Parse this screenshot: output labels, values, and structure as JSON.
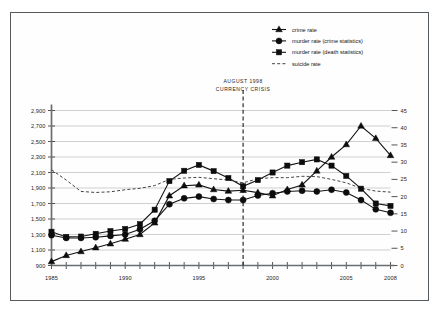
{
  "figure": {
    "border_color": "#555a5e",
    "background": "#ffffff"
  },
  "annotation": {
    "line1": "AUGUST 1998",
    "line2": "CURRENCY CRISIS",
    "year": 1998
  },
  "legend": {
    "position": "top-right",
    "items": [
      {
        "label": "crime rate",
        "marker": "triangle",
        "style": "solid"
      },
      {
        "label": "murder rate (crime statistics)",
        "marker": "circle",
        "style": "solid"
      },
      {
        "label": "murder rate (death statistics)",
        "marker": "square",
        "style": "solid"
      },
      {
        "label": "suicide rate",
        "marker": "none",
        "style": "dashed"
      }
    ]
  },
  "axes": {
    "left": {
      "ticks": [
        900,
        1100,
        1300,
        1500,
        1700,
        1900,
        2100,
        2300,
        2500,
        2700,
        2900
      ],
      "tick_labels": [
        "900",
        "1,100",
        "1,300",
        "1,500",
        "1,700",
        "1,900",
        "2,100",
        "2,300",
        "2,500",
        "2,700",
        "2,900"
      ],
      "min": 900,
      "max": 2900
    },
    "right": {
      "ticks": [
        0,
        5,
        10,
        15,
        20,
        25,
        30,
        35,
        40,
        45
      ],
      "tick_labels": [
        "0",
        "5",
        "10",
        "15",
        "20",
        "25",
        "30",
        "35",
        "40",
        "45"
      ],
      "min": 0,
      "max": 45
    },
    "bottom": {
      "min": 1985,
      "max": 2008,
      "tick_labels": [
        "1985",
        "1990",
        "1995",
        "2000",
        "2005",
        "2008"
      ],
      "tick_label_years": [
        1985,
        1990,
        1995,
        2000,
        2005,
        2008
      ]
    }
  },
  "chart_data": {
    "type": "line",
    "title": "",
    "xlabel": "",
    "ylabel": "",
    "grid": true,
    "legend_position": "top-right",
    "x": [
      1985,
      1986,
      1987,
      1988,
      1989,
      1990,
      1991,
      1992,
      1993,
      1994,
      1995,
      1996,
      1997,
      1998,
      1999,
      2000,
      2001,
      2002,
      2003,
      2004,
      2005,
      2006,
      2007,
      2008
    ],
    "xlim": [
      1985,
      2008
    ],
    "ylim_left": [
      900,
      2900
    ],
    "ylim_right": [
      0,
      45
    ],
    "series": [
      {
        "name": "crime rate",
        "axis": "left",
        "marker": "triangle",
        "style": "solid",
        "values": [
          950,
          1030,
          1080,
          1130,
          1180,
          1240,
          1300,
          1450,
          1800,
          1930,
          1940,
          1880,
          1860,
          1870,
          1840,
          1800,
          1880,
          1940,
          2120,
          2300,
          2460,
          2700,
          2540,
          2320
        ]
      },
      {
        "name": "murder rate (crime statistics)",
        "axis": "right",
        "marker": "circle",
        "style": "solid",
        "values": [
          8.8,
          8.0,
          8.0,
          8.2,
          8.6,
          9.0,
          10.5,
          13.0,
          17.8,
          19.5,
          20.0,
          19.3,
          19.0,
          19.0,
          20.3,
          21.0,
          21.5,
          21.7,
          21.5,
          22.0,
          21.2,
          19.0,
          16.3,
          15.3
        ]
      },
      {
        "name": "murder rate (death statistics)",
        "axis": "right",
        "marker": "square",
        "style": "solid",
        "values": [
          9.8,
          8.3,
          8.4,
          9.2,
          10.0,
          10.6,
          12.0,
          16.2,
          24.5,
          27.5,
          29.2,
          27.4,
          25.4,
          23.0,
          24.8,
          27.0,
          29.0,
          30.0,
          30.8,
          29.0,
          26.0,
          22.3,
          18.0,
          17.3
        ]
      },
      {
        "name": "suicide rate",
        "axis": "right",
        "marker": "none",
        "style": "dashed",
        "values": [
          27.8,
          24.8,
          21.5,
          21.2,
          21.4,
          22.0,
          22.4,
          23.2,
          25.0,
          25.4,
          25.6,
          25.2,
          24.8,
          24.0,
          25.2,
          25.5,
          25.5,
          25.9,
          25.8,
          25.0,
          24.0,
          22.4,
          21.6,
          21.3
        ]
      }
    ],
    "annotations": [
      {
        "text": "AUGUST 1998 CURRENCY CRISIS",
        "x": 1998,
        "type": "vertical-dashed-line"
      }
    ]
  }
}
